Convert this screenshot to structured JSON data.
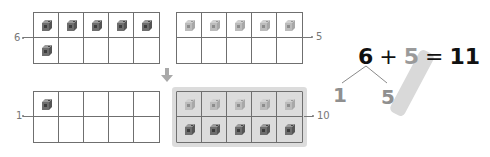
{
  "grids": {
    "top_left": {
      "label": "6",
      "label_side": "left",
      "filled_dark": 6,
      "highlighted": false
    },
    "top_right": {
      "label": "5",
      "label_side": "right",
      "filled_light": 5,
      "highlighted": false
    },
    "bottom_left": {
      "label": "1",
      "label_side": "left",
      "filled_dark": 1,
      "highlighted": false
    },
    "bottom_right": {
      "label": "10",
      "label_side": "right",
      "filled_light": 5,
      "filled_dark": 5,
      "highlighted": true
    }
  },
  "arrow": {
    "direction": "down",
    "icon": "arrow-down-icon"
  },
  "equation": {
    "left": "6",
    "plus": "+",
    "right": "5",
    "equals": "=",
    "result": "11"
  },
  "decomposition": {
    "part1": "1",
    "part2": "5"
  },
  "colors": {
    "grid_line": "#6f6f6f",
    "dark_cube": "#6e6e6e",
    "light_cube": "#b8b8b8",
    "highlight": "#dcdcdc",
    "equation_text": "#111111",
    "muted_number": "#9a9a9a"
  }
}
